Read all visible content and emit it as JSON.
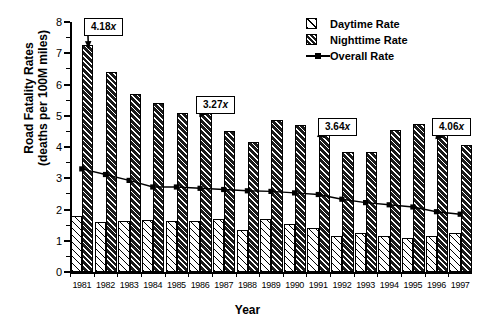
{
  "chart_data": {
    "type": "bar",
    "title": "",
    "xlabel": "Year",
    "ylabel": "Road Fatality Rates\n(deaths per 100M miles)",
    "ylim": [
      0,
      8
    ],
    "yticks": [
      0,
      1,
      2,
      3,
      4,
      5,
      6,
      7,
      8
    ],
    "ytick_labels": [
      "0",
      "1",
      "2",
      "3",
      "4",
      "5",
      "6",
      "7",
      "8"
    ],
    "grid": false,
    "legend_position": "top-right",
    "categories": [
      "1981",
      "1982",
      "1983",
      "1984",
      "1985",
      "1986",
      "1987",
      "1988",
      "1989",
      "1990",
      "1991",
      "1992",
      "1993",
      "1994",
      "1995",
      "1996",
      "1997"
    ],
    "series": [
      {
        "name": "Daytime Rate",
        "type": "bar",
        "values": [
          1.78,
          1.6,
          1.64,
          1.65,
          1.62,
          1.62,
          1.7,
          1.35,
          1.7,
          1.55,
          1.4,
          1.15,
          1.25,
          1.15,
          1.1,
          1.15,
          1.25
        ]
      },
      {
        "name": "Nighttime Rate",
        "type": "bar",
        "values": [
          7.25,
          6.4,
          5.7,
          5.4,
          5.1,
          5.15,
          4.5,
          4.15,
          4.85,
          4.7,
          4.4,
          3.85,
          3.85,
          4.55,
          4.75,
          4.4,
          4.05
        ]
      },
      {
        "name": "Overall Rate",
        "type": "line",
        "values": [
          3.3,
          3.12,
          2.93,
          2.72,
          2.72,
          2.68,
          2.64,
          2.6,
          2.58,
          2.53,
          2.48,
          2.33,
          2.22,
          2.15,
          2.08,
          1.93,
          1.85
        ]
      }
    ],
    "annotations": [
      {
        "label": "4.18x",
        "value": "4.18",
        "unit": "x",
        "category": "1981",
        "points_to": "Nighttime Rate"
      },
      {
        "label": "3.27x",
        "value": "3.27",
        "unit": "x",
        "category": "1986",
        "points_to": "Nighttime Rate"
      },
      {
        "label": "3.64x",
        "value": "3.64",
        "unit": "x",
        "category": "1991",
        "points_to": "Nighttime Rate"
      },
      {
        "label": "4.06x",
        "value": "4.06",
        "unit": "x",
        "category": "1996",
        "points_to": "Nighttime Rate"
      }
    ]
  },
  "legend": {
    "entries": [
      {
        "label": "Daytime Rate",
        "swatch": "hatch-light-swatch"
      },
      {
        "label": "Nighttime Rate",
        "swatch": "hatch-dark-swatch"
      },
      {
        "label": "Overall Rate",
        "swatch": "line-marker-swatch"
      }
    ]
  },
  "axes": {
    "x_title": "Year",
    "y_title_line1": "Road Fatality Rates",
    "y_title_line2": "(deaths per 100M miles)"
  },
  "colors": {
    "foreground": "#000000",
    "background": "#ffffff",
    "night_fill": "#1a1a1a",
    "day_fill": "#ffffff"
  }
}
